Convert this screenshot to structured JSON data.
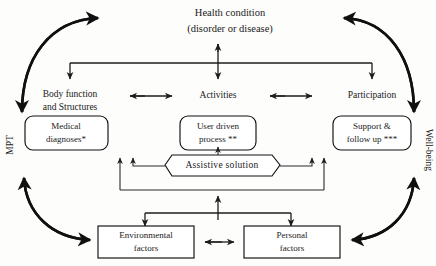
{
  "diagram": {
    "title_top": {
      "line1": "Health condition",
      "line2": "(disorder or disease)"
    },
    "domains": [
      {
        "id": "body-function",
        "line1": "Body function",
        "line2": "and Structures"
      },
      {
        "id": "activities",
        "line1": "Activities",
        "line2": ""
      },
      {
        "id": "participation",
        "line1": "Participation",
        "line2": ""
      }
    ],
    "process_boxes": [
      {
        "id": "medical-diagnoses",
        "line1": "Medical",
        "line2": "diagnoses*"
      },
      {
        "id": "user-driven-process",
        "line1": "User driven",
        "line2": "process **"
      },
      {
        "id": "support-follow-up",
        "line1": "Support &",
        "line2": "follow up ***"
      }
    ],
    "assistive_solution": {
      "id": "assistive-solution",
      "label": "Assistive solution"
    },
    "context_boxes": [
      {
        "id": "environmental-factors",
        "line1": "Environmental",
        "line2": "factors"
      },
      {
        "id": "personal-factors",
        "line1": "Personal",
        "line2": "factors"
      }
    ],
    "side_labels": {
      "left": "MPT",
      "right": "Well-being"
    },
    "colors": {
      "stroke": "#111111",
      "text": "#1a1a1a",
      "background": "#fdfdfc"
    }
  }
}
